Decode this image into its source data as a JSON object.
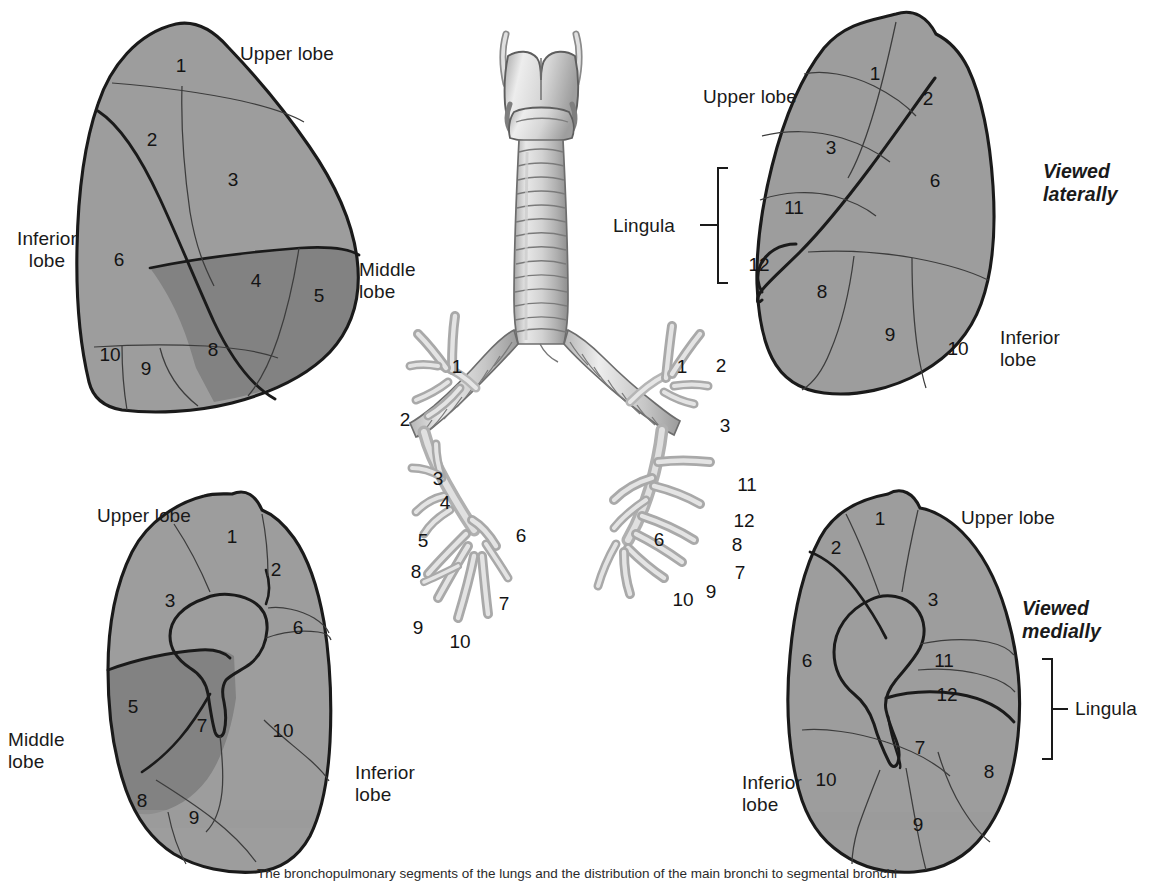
{
  "figure": {
    "caption": "The bronchopulmonary segments of the lungs and the distribution of the main bronchi to segmental bronchi",
    "background_color": "#ffffff"
  },
  "colors": {
    "lung_fill": "#9d9d9d",
    "lobe_fill_dark": "#828282",
    "hilum_fill": "#9a9a9a",
    "outline": "#1a1a1a",
    "inner_line": "#3c3c3c",
    "airway_light": "#e2e2e2",
    "airway_mid": "#bdbdbd",
    "airway_dark": "#9a9a9a",
    "text": "#1a1a1a"
  },
  "panels": {
    "top_left": {
      "name": "Right lung viewed laterally",
      "labels": [
        {
          "text": "Upper lobe",
          "x": 240,
          "y": 43
        },
        {
          "text": "Inferior\nlobe",
          "x": 8,
          "y": 228
        },
        {
          "text": "Middle\nlobe",
          "x": 359,
          "y": 259
        }
      ],
      "segments": [
        {
          "n": "1",
          "x": 181,
          "y": 66
        },
        {
          "n": "2",
          "x": 152,
          "y": 140
        },
        {
          "n": "3",
          "x": 233,
          "y": 180
        },
        {
          "n": "6",
          "x": 119,
          "y": 260
        },
        {
          "n": "4",
          "x": 256,
          "y": 281
        },
        {
          "n": "5",
          "x": 319,
          "y": 296
        },
        {
          "n": "8",
          "x": 213,
          "y": 350
        },
        {
          "n": "9",
          "x": 146,
          "y": 369
        },
        {
          "n": "10",
          "x": 110,
          "y": 355
        }
      ]
    },
    "top_right": {
      "name": "Left lung viewed laterally",
      "labels": [
        {
          "text": "Upper lobe",
          "x": 703,
          "y": 86
        },
        {
          "text": "Lingula",
          "x": 640,
          "y": 226
        },
        {
          "text": "Inferior\nlobe",
          "x": 1000,
          "y": 327
        },
        {
          "text": "Viewed\nlaterally",
          "x": 1043,
          "y": 160,
          "style": "view"
        }
      ],
      "segments": [
        {
          "n": "1",
          "x": 875,
          "y": 74
        },
        {
          "n": "2",
          "x": 928,
          "y": 99
        },
        {
          "n": "3",
          "x": 831,
          "y": 148
        },
        {
          "n": "6",
          "x": 935,
          "y": 181
        },
        {
          "n": "11",
          "x": 794,
          "y": 208
        },
        {
          "n": "12",
          "x": 759,
          "y": 265
        },
        {
          "n": "8",
          "x": 822,
          "y": 292
        },
        {
          "n": "9",
          "x": 890,
          "y": 335
        },
        {
          "n": "10",
          "x": 958,
          "y": 349
        }
      ],
      "bracket": {
        "x": 718,
        "y_top": 173,
        "y_bottom": 278
      }
    },
    "bottom_left": {
      "name": "Right lung viewed medially",
      "labels": [
        {
          "text": "Upper lobe",
          "x": 97,
          "y": 505
        },
        {
          "text": "Middle\nlobe",
          "x": 8,
          "y": 729
        },
        {
          "text": "Inferior\nlobe",
          "x": 355,
          "y": 762
        }
      ],
      "segments": [
        {
          "n": "1",
          "x": 232,
          "y": 537
        },
        {
          "n": "2",
          "x": 276,
          "y": 570
        },
        {
          "n": "3",
          "x": 170,
          "y": 601
        },
        {
          "n": "6",
          "x": 298,
          "y": 628
        },
        {
          "n": "5",
          "x": 133,
          "y": 707
        },
        {
          "n": "7",
          "x": 202,
          "y": 726
        },
        {
          "n": "10",
          "x": 283,
          "y": 731
        },
        {
          "n": "8",
          "x": 142,
          "y": 801
        },
        {
          "n": "9",
          "x": 194,
          "y": 818
        }
      ]
    },
    "bottom_right": {
      "name": "Left lung viewed medially",
      "labels": [
        {
          "text": "Upper lobe",
          "x": 961,
          "y": 507
        },
        {
          "text": "Lingula",
          "x": 1078,
          "y": 728
        },
        {
          "text": "Inferior\nlobe",
          "x": 742,
          "y": 772
        },
        {
          "text": "Viewed\nmedially",
          "x": 1022,
          "y": 597,
          "style": "view"
        }
      ],
      "segments": [
        {
          "n": "1",
          "x": 880,
          "y": 519
        },
        {
          "n": "2",
          "x": 836,
          "y": 548
        },
        {
          "n": "3",
          "x": 933,
          "y": 600
        },
        {
          "n": "6",
          "x": 807,
          "y": 661
        },
        {
          "n": "11",
          "x": 944,
          "y": 661
        },
        {
          "n": "12",
          "x": 947,
          "y": 695
        },
        {
          "n": "7",
          "x": 920,
          "y": 748
        },
        {
          "n": "8",
          "x": 989,
          "y": 772
        },
        {
          "n": "10",
          "x": 826,
          "y": 780
        },
        {
          "n": "9",
          "x": 918,
          "y": 825
        }
      ],
      "bracket": {
        "x": 1047,
        "y_top": 662,
        "y_bottom": 755
      }
    },
    "center": {
      "name": "Tracheobronchial tree with larynx and trachea",
      "left_branch_numbers": [
        {
          "n": "1",
          "x": 457,
          "y": 367
        },
        {
          "n": "2",
          "x": 405,
          "y": 420
        },
        {
          "n": "3",
          "x": 438,
          "y": 479
        },
        {
          "n": "4",
          "x": 445,
          "y": 500
        },
        {
          "n": "5",
          "x": 423,
          "y": 538
        },
        {
          "n": "6",
          "x": 521,
          "y": 536
        },
        {
          "n": "8",
          "x": 416,
          "y": 572
        },
        {
          "n": "7",
          "x": 504,
          "y": 604
        },
        {
          "n": "9",
          "x": 418,
          "y": 628
        },
        {
          "n": "10",
          "x": 458,
          "y": 640
        }
      ],
      "right_branch_numbers": [
        {
          "n": "1",
          "x": 682,
          "y": 367
        },
        {
          "n": "2",
          "x": 721,
          "y": 366
        },
        {
          "n": "3",
          "x": 725,
          "y": 426
        },
        {
          "n": "11",
          "x": 745,
          "y": 485
        },
        {
          "n": "12",
          "x": 742,
          "y": 521
        },
        {
          "n": "6",
          "x": 659,
          "y": 540
        },
        {
          "n": "8",
          "x": 737,
          "y": 545
        },
        {
          "n": "7",
          "x": 740,
          "y": 573
        },
        {
          "n": "9",
          "x": 711,
          "y": 592
        },
        {
          "n": "10",
          "x": 681,
          "y": 600
        }
      ]
    }
  }
}
